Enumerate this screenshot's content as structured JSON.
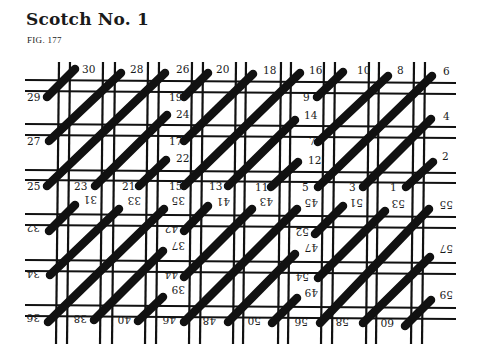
{
  "title": "Scotch No. 1",
  "figure": "FIG. 177",
  "colors": {
    "ink": "#111111",
    "background": "#ffffff"
  },
  "grid": {
    "vertical_lines_x": [
      59,
      70,
      103,
      115,
      148,
      159,
      192,
      203,
      236,
      246,
      281,
      291,
      324,
      335,
      369,
      379,
      414,
      425
    ],
    "horizontal_lines_y": [
      80,
      91,
      124,
      135,
      170,
      180,
      214,
      225,
      260,
      271,
      305,
      316
    ],
    "x_range": [
      25,
      456
    ],
    "y_range": [
      62,
      344
    ],
    "line_width": 2.2,
    "tilt_px": 3
  },
  "stitches": [
    {
      "from": "29",
      "to": "30",
      "x1": 47,
      "y1": 97,
      "x2": 75,
      "y2": 69
    },
    {
      "from": "27",
      "to": "28",
      "x1": 49,
      "y1": 141,
      "x2": 121,
      "y2": 73
    },
    {
      "from": "25",
      "to": "26",
      "x1": 47,
      "y1": 186,
      "x2": 165,
      "y2": 73
    },
    {
      "from": "23",
      "to": "24",
      "x1": 95,
      "y1": 186,
      "x2": 167,
      "y2": 115
    },
    {
      "from": "21",
      "to": "22",
      "x1": 139,
      "y1": 186,
      "x2": 166,
      "y2": 160
    },
    {
      "from": "19",
      "to": "20",
      "x1": 184,
      "y1": 97,
      "x2": 208,
      "y2": 73
    },
    {
      "from": "17",
      "to": "18",
      "x1": 184,
      "y1": 141,
      "x2": 253,
      "y2": 74
    },
    {
      "from": "15",
      "to": "16",
      "x1": 184,
      "y1": 186,
      "x2": 300,
      "y2": 73
    },
    {
      "from": "13",
      "to": "14",
      "x1": 228,
      "y1": 186,
      "x2": 295,
      "y2": 120
    },
    {
      "from": "11",
      "to": "12",
      "x1": 271,
      "y1": 187,
      "x2": 298,
      "y2": 162
    },
    {
      "from": "9",
      "to": "10",
      "x1": 317,
      "y1": 97,
      "x2": 343,
      "y2": 72
    },
    {
      "from": "7",
      "to": "8",
      "x1": 318,
      "y1": 142,
      "x2": 388,
      "y2": 76
    },
    {
      "from": "5",
      "to": "6",
      "x1": 318,
      "y1": 187,
      "x2": 432,
      "y2": 76
    },
    {
      "from": "3",
      "to": "4",
      "x1": 363,
      "y1": 187,
      "x2": 431,
      "y2": 119
    },
    {
      "from": "1",
      "to": "2",
      "x1": 406,
      "y1": 187,
      "x2": 433,
      "y2": 162
    },
    {
      "from": "32",
      "to": "31",
      "x1": 49,
      "y1": 231,
      "x2": 75,
      "y2": 205
    },
    {
      "from": "34",
      "to": "33",
      "x1": 50,
      "y1": 275,
      "x2": 119,
      "y2": 209
    },
    {
      "from": "36",
      "to": "35",
      "x1": 48,
      "y1": 322,
      "x2": 164,
      "y2": 209
    },
    {
      "from": "38",
      "to": "37",
      "x1": 94,
      "y1": 320,
      "x2": 163,
      "y2": 251
    },
    {
      "from": "40",
      "to": "39",
      "x1": 138,
      "y1": 321,
      "x2": 163,
      "y2": 297
    },
    {
      "from": "42",
      "to": "41",
      "x1": 184,
      "y1": 231,
      "x2": 208,
      "y2": 206
    },
    {
      "from": "44",
      "to": "43",
      "x1": 184,
      "y1": 277,
      "x2": 252,
      "y2": 209
    },
    {
      "from": "46",
      "to": "45",
      "x1": 184,
      "y1": 322,
      "x2": 297,
      "y2": 209
    },
    {
      "from": "48",
      "to": "47",
      "x1": 228,
      "y1": 322,
      "x2": 295,
      "y2": 254
    },
    {
      "from": "50",
      "to": "49",
      "x1": 272,
      "y1": 323,
      "x2": 297,
      "y2": 298
    },
    {
      "from": "52",
      "to": "51",
      "x1": 315,
      "y1": 234,
      "x2": 343,
      "y2": 206
    },
    {
      "from": "54",
      "to": "53",
      "x1": 318,
      "y1": 278,
      "x2": 385,
      "y2": 211
    },
    {
      "from": "56",
      "to": "55",
      "x1": 320,
      "y1": 323,
      "x2": 429,
      "y2": 209
    },
    {
      "from": "58",
      "to": "57",
      "x1": 363,
      "y1": 323,
      "x2": 430,
      "y2": 257
    },
    {
      "from": "60",
      "to": "59",
      "x1": 405,
      "y1": 326,
      "x2": 431,
      "y2": 300
    }
  ],
  "labels_upright": [
    {
      "text": "30",
      "x": 82,
      "y": 73
    },
    {
      "text": "28",
      "x": 130,
      "y": 73
    },
    {
      "text": "26",
      "x": 176,
      "y": 73
    },
    {
      "text": "20",
      "x": 216,
      "y": 73
    },
    {
      "text": "18",
      "x": 263,
      "y": 74
    },
    {
      "text": "16",
      "x": 309,
      "y": 74
    },
    {
      "text": "10",
      "x": 357,
      "y": 74
    },
    {
      "text": "8",
      "x": 397,
      "y": 74
    },
    {
      "text": "6",
      "x": 443,
      "y": 75
    },
    {
      "text": "29",
      "x": 27,
      "y": 101
    },
    {
      "text": "19",
      "x": 169,
      "y": 101
    },
    {
      "text": "9",
      "x": 303,
      "y": 101
    },
    {
      "text": "24",
      "x": 176,
      "y": 118
    },
    {
      "text": "14",
      "x": 304,
      "y": 119
    },
    {
      "text": "4",
      "x": 443,
      "y": 120
    },
    {
      "text": "27",
      "x": 27,
      "y": 145
    },
    {
      "text": "17",
      "x": 169,
      "y": 145
    },
    {
      "text": "7",
      "x": 309,
      "y": 145
    },
    {
      "text": "22",
      "x": 176,
      "y": 162
    },
    {
      "text": "12",
      "x": 308,
      "y": 164
    },
    {
      "text": "2",
      "x": 442,
      "y": 160
    },
    {
      "text": "25",
      "x": 27,
      "y": 190
    },
    {
      "text": "23",
      "x": 74,
      "y": 190
    },
    {
      "text": "21",
      "x": 122,
      "y": 190
    },
    {
      "text": "15",
      "x": 169,
      "y": 190
    },
    {
      "text": "13",
      "x": 209,
      "y": 190
    },
    {
      "text": "11",
      "x": 255,
      "y": 191
    },
    {
      "text": "5",
      "x": 302,
      "y": 191
    },
    {
      "text": "3",
      "x": 349,
      "y": 191
    },
    {
      "text": "1",
      "x": 390,
      "y": 191
    }
  ],
  "labels_inverted": [
    {
      "text": "31",
      "x": 84,
      "y": 204
    },
    {
      "text": "33",
      "x": 128,
      "y": 205
    },
    {
      "text": "35",
      "x": 172,
      "y": 205
    },
    {
      "text": "41",
      "x": 217,
      "y": 206
    },
    {
      "text": "43",
      "x": 260,
      "y": 206
    },
    {
      "text": "45",
      "x": 305,
      "y": 207
    },
    {
      "text": "51",
      "x": 350,
      "y": 207
    },
    {
      "text": "53",
      "x": 392,
      "y": 208
    },
    {
      "text": "55",
      "x": 440,
      "y": 209
    },
    {
      "text": "32",
      "x": 27,
      "y": 232
    },
    {
      "text": "42",
      "x": 165,
      "y": 233
    },
    {
      "text": "52",
      "x": 296,
      "y": 236
    },
    {
      "text": "37",
      "x": 172,
      "y": 250
    },
    {
      "text": "47",
      "x": 305,
      "y": 252
    },
    {
      "text": "57",
      "x": 440,
      "y": 253
    },
    {
      "text": "34",
      "x": 27,
      "y": 278
    },
    {
      "text": "44",
      "x": 165,
      "y": 279
    },
    {
      "text": "54",
      "x": 296,
      "y": 281
    },
    {
      "text": "39",
      "x": 172,
      "y": 294
    },
    {
      "text": "49",
      "x": 305,
      "y": 297
    },
    {
      "text": "59",
      "x": 440,
      "y": 299
    },
    {
      "text": "36",
      "x": 27,
      "y": 322
    },
    {
      "text": "38",
      "x": 74,
      "y": 323
    },
    {
      "text": "40",
      "x": 118,
      "y": 324
    },
    {
      "text": "46",
      "x": 163,
      "y": 324
    },
    {
      "text": "48",
      "x": 203,
      "y": 325
    },
    {
      "text": "50",
      "x": 248,
      "y": 325
    },
    {
      "text": "56",
      "x": 295,
      "y": 326
    },
    {
      "text": "58",
      "x": 336,
      "y": 326
    },
    {
      "text": "60",
      "x": 381,
      "y": 327
    }
  ]
}
